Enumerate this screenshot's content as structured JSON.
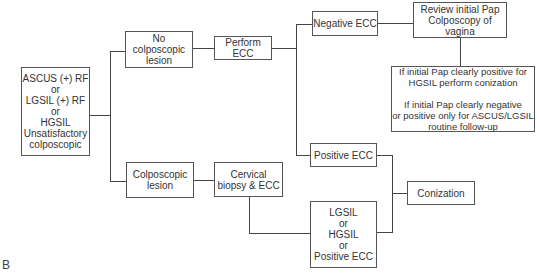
{
  "diagram": {
    "panel_label": "B",
    "nodes": {
      "start": "ASCUS (+) RF\nor\nLGSIL (+) RF\nor\nHGSIL\nUnsatisfactory\ncolposcopic",
      "no_lesion": "No colposcopic\nlesion",
      "perform_ecc": "Perform ECC",
      "negative_ecc": "Negative ECC",
      "review": "Review initial Pap\nColposcopy of vagina",
      "instructions": "If initial Pap clearly positive for\nHGSIL perform conization\n\nIf initial Pap clearly negative\nor positive only for ASCUS/LGSIL\nroutine follow-up",
      "lesion": "Colposcopic\nlesion",
      "biopsy": "Cervical\nbiopsy & ECC",
      "positive_ecc": "Positive ECC",
      "conization": "Conization",
      "lgsil_hgsil": "LGSIL\nor\nHGSIL\nor\nPositive ECC"
    }
  }
}
